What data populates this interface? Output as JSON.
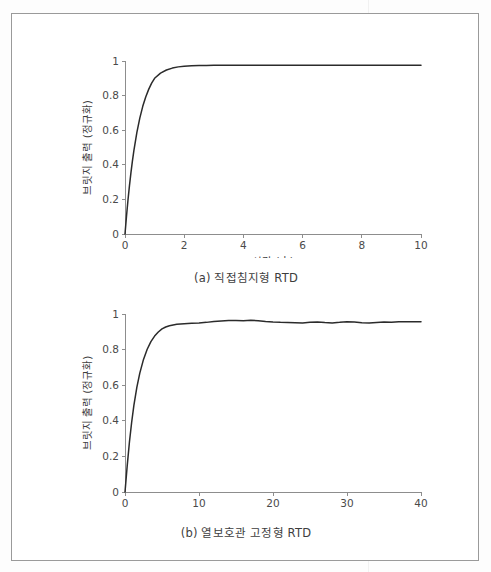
{
  "page": {
    "background_color": "#ffffff",
    "frame_color": "#9a9a9a"
  },
  "figures": [
    {
      "id": "a",
      "caption": "(a) 직접침지형 RTD"
    },
    {
      "id": "b",
      "caption": "(b) 열보호관 고정형 RTD"
    }
  ],
  "chart_data": [
    {
      "type": "line",
      "id": "chart-a",
      "title": "",
      "caption": "(a) 직접침지형 RTD",
      "xlabel": "시간 (초)",
      "ylabel": "브릿지 출력 (정규화)",
      "xlim": [
        0,
        10
      ],
      "ylim": [
        0,
        1
      ],
      "xticks": [
        0,
        2,
        4,
        6,
        8,
        10
      ],
      "xtick_labels": [
        "0",
        "2",
        "4",
        "6",
        "8",
        "10"
      ],
      "yticks": [
        0,
        0.2,
        0.4,
        0.6,
        0.8,
        1
      ],
      "ytick_labels": [
        "0",
        "0.2",
        "0.4",
        "0.6",
        "0.8",
        "1"
      ],
      "grid": false,
      "legend": false,
      "line_color": "#2b2b2b",
      "series": [
        {
          "name": "직접침지형 RTD 계단응답",
          "description": "1차 지수 상승, 시정수 약 0.45초, 정상상태 약 0.975",
          "x": [
            0.0,
            0.05,
            0.1,
            0.15,
            0.2,
            0.25,
            0.3,
            0.4,
            0.5,
            0.6,
            0.7,
            0.8,
            0.9,
            1.0,
            1.2,
            1.4,
            1.6,
            1.8,
            2.0,
            2.25,
            2.5,
            2.75,
            3.0,
            3.5,
            4.0,
            4.5,
            5.0,
            5.5,
            6.0,
            6.5,
            7.0,
            7.5,
            8.0,
            8.5,
            9.0,
            9.5,
            10.0
          ],
          "y": [
            0.0,
            0.102,
            0.195,
            0.278,
            0.353,
            0.421,
            0.482,
            0.586,
            0.67,
            0.738,
            0.792,
            0.836,
            0.872,
            0.9,
            0.93,
            0.948,
            0.959,
            0.966,
            0.97,
            0.972,
            0.974,
            0.974,
            0.975,
            0.975,
            0.975,
            0.975,
            0.975,
            0.975,
            0.975,
            0.975,
            0.975,
            0.975,
            0.975,
            0.975,
            0.975,
            0.975,
            0.975
          ]
        }
      ]
    },
    {
      "type": "line",
      "id": "chart-b",
      "title": "",
      "caption": "(b) 열보호관 고정형 RTD",
      "xlabel": "시간 (초)",
      "ylabel": "브릿지 출력 (정규화)",
      "xlim": [
        0,
        40
      ],
      "ylim": [
        0,
        1
      ],
      "xticks": [
        0,
        10,
        20,
        30,
        40
      ],
      "xtick_labels": [
        "0",
        "10",
        "20",
        "30",
        "40"
      ],
      "yticks": [
        0,
        0.2,
        0.4,
        0.6,
        0.8,
        1
      ],
      "ytick_labels": [
        "0",
        "0.2",
        "0.4",
        "0.6",
        "0.8",
        "1"
      ],
      "grid": false,
      "legend": false,
      "line_color": "#2b2b2b",
      "series": [
        {
          "name": "열보호관 고정형 RTD 계단응답",
          "description": "1차 지수 상승, 시정수 약 1.9초, 정상상태 약 0.955, 잔류 노이즈 포함",
          "x": [
            0.0,
            0.3,
            0.6,
            0.9,
            1.2,
            1.6,
            2.0,
            2.5,
            3.0,
            3.5,
            4.0,
            4.5,
            5.0,
            5.5,
            6.0,
            7.0,
            8.0,
            9.0,
            10.0,
            11.0,
            12.0,
            13.0,
            14.0,
            15.0,
            16.0,
            17.0,
            18.0,
            19.0,
            20.0,
            21.0,
            22.0,
            23.0,
            24.0,
            25.0,
            26.0,
            27.0,
            28.0,
            29.0,
            30.0,
            31.0,
            32.0,
            33.0,
            34.0,
            35.0,
            36.0,
            37.0,
            38.0,
            39.0,
            40.0
          ],
          "y": [
            0.0,
            0.148,
            0.281,
            0.392,
            0.487,
            0.588,
            0.668,
            0.745,
            0.802,
            0.845,
            0.876,
            0.899,
            0.916,
            0.927,
            0.934,
            0.942,
            0.945,
            0.948,
            0.95,
            0.953,
            0.958,
            0.961,
            0.964,
            0.963,
            0.962,
            0.965,
            0.962,
            0.958,
            0.955,
            0.953,
            0.952,
            0.951,
            0.95,
            0.953,
            0.955,
            0.952,
            0.95,
            0.953,
            0.957,
            0.955,
            0.951,
            0.949,
            0.952,
            0.955,
            0.953,
            0.956,
            0.957,
            0.956,
            0.957
          ]
        }
      ]
    }
  ]
}
